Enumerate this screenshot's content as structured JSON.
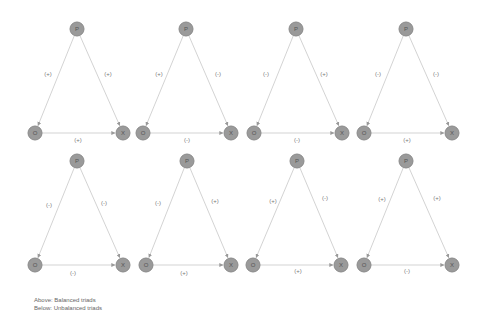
{
  "caption": {
    "line1": "Above: Balanced triads",
    "line2": "Below: Unbalanced triads"
  },
  "node_labels": {
    "p": "P",
    "o": "O",
    "x": "X"
  },
  "colors": {
    "node_fill": "#9a9a9a",
    "edge": "#c8c8c8",
    "label": "#777777"
  },
  "triads": [
    {
      "row": "balanced",
      "P": [
        77,
        29
      ],
      "O": [
        35,
        133
      ],
      "X": [
        123,
        133
      ],
      "po": "(+)",
      "px": "(+)",
      "ox": "(+)",
      "lpo": [
        48,
        74
      ],
      "lpx": [
        108,
        74
      ],
      "lox": [
        78,
        140
      ]
    },
    {
      "row": "balanced",
      "P": [
        186,
        29
      ],
      "O": [
        143,
        133
      ],
      "X": [
        231,
        133
      ],
      "po": "(+)",
      "px": "(-)",
      "ox": "(-)",
      "lpo": [
        159,
        74
      ],
      "lpx": [
        218,
        74
      ],
      "lox": [
        187,
        140
      ]
    },
    {
      "row": "balanced",
      "P": [
        296,
        29
      ],
      "O": [
        254,
        133
      ],
      "X": [
        342,
        133
      ],
      "po": "(-)",
      "px": "(+)",
      "ox": "(-)",
      "lpo": [
        266,
        74
      ],
      "lpx": [
        324,
        74
      ],
      "lox": [
        297,
        140
      ]
    },
    {
      "row": "balanced",
      "P": [
        406,
        29
      ],
      "O": [
        364,
        133
      ],
      "X": [
        452,
        133
      ],
      "po": "(-)",
      "px": "(-)",
      "ox": "(+)",
      "lpo": [
        378,
        74
      ],
      "lpx": [
        436,
        74
      ],
      "lox": [
        407,
        140
      ]
    },
    {
      "row": "unbalanced",
      "P": [
        77,
        161
      ],
      "O": [
        35,
        265
      ],
      "X": [
        123,
        265
      ],
      "po": "(-)",
      "px": "(-)",
      "ox": "(-)",
      "lpo": [
        49,
        205
      ],
      "lpx": [
        104,
        203
      ],
      "lox": [
        73,
        273
      ]
    },
    {
      "row": "unbalanced",
      "P": [
        187,
        161
      ],
      "O": [
        146,
        265
      ],
      "X": [
        231,
        265
      ],
      "po": "(-)",
      "px": "(+)",
      "ox": "(+)",
      "lpo": [
        158,
        203
      ],
      "lpx": [
        215,
        201
      ],
      "lox": [
        184,
        273
      ]
    },
    {
      "row": "unbalanced",
      "P": [
        297,
        161
      ],
      "O": [
        253,
        265
      ],
      "X": [
        341,
        265
      ],
      "po": "(+)",
      "px": "(-)",
      "ox": "(+)",
      "lpo": [
        273,
        201
      ],
      "lpx": [
        325,
        198
      ],
      "lox": [
        298,
        271
      ]
    },
    {
      "row": "unbalanced",
      "P": [
        406,
        161
      ],
      "O": [
        364,
        265
      ],
      "X": [
        452,
        265
      ],
      "po": "(+)",
      "px": "(+)",
      "ox": "(-)",
      "lpo": [
        382,
        199
      ],
      "lpx": [
        437,
        198
      ],
      "lox": [
        407,
        271
      ]
    }
  ]
}
